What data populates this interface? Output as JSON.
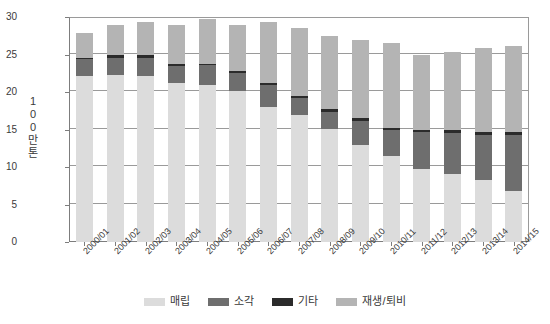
{
  "chart_data": {
    "type": "bar",
    "title": "",
    "subtitle": "",
    "xlabel": "",
    "ylabel": "100만 톤",
    "ylim": [
      0,
      30
    ],
    "yticks": [
      0,
      5,
      10,
      15,
      20,
      25,
      30
    ],
    "grid": true,
    "stacked": true,
    "legend_position": "bottom",
    "categories": [
      "2000/01",
      "2001/02",
      "2002/03",
      "2003/04",
      "2004/05",
      "2005/06",
      "2006/07",
      "2007/08",
      "2008/09",
      "2009/10",
      "2010/11",
      "2011/12",
      "2012/13",
      "2013/14",
      "2014/15"
    ],
    "series": [
      {
        "name": "매립",
        "color": "#dcdcdc",
        "values": [
          22.1,
          22.3,
          22.1,
          21.2,
          20.9,
          20.1,
          18.0,
          17.0,
          15.1,
          13.0,
          11.5,
          9.8,
          9.1,
          8.3,
          6.8
        ]
      },
      {
        "name": "소각",
        "color": "#6e6e6e",
        "values": [
          2.3,
          2.3,
          2.5,
          2.3,
          2.7,
          2.5,
          3.0,
          2.2,
          2.3,
          3.2,
          3.4,
          4.9,
          5.4,
          6.0,
          7.5
        ]
      },
      {
        "name": "기타",
        "color": "#2b2b2b",
        "values": [
          0.2,
          0.3,
          0.3,
          0.2,
          0.2,
          0.2,
          0.2,
          0.3,
          0.3,
          0.3,
          0.3,
          0.3,
          0.4,
          0.4,
          0.4
        ]
      },
      {
        "name": "재생/퇴비",
        "color": "#b4b4b4",
        "values": [
          3.3,
          4.0,
          4.5,
          5.2,
          5.9,
          6.1,
          8.1,
          9.1,
          9.8,
          10.5,
          11.4,
          10.0,
          10.4,
          11.2,
          11.5
        ]
      }
    ],
    "totals": [
      27.9,
      28.9,
      29.4,
      28.9,
      29.7,
      28.9,
      29.3,
      28.6,
      27.5,
      27.0,
      26.6,
      25.0,
      25.3,
      25.9,
      26.2
    ]
  },
  "legend": {
    "items": [
      {
        "label": "매립",
        "color": "#dcdcdc"
      },
      {
        "label": "소각",
        "color": "#6e6e6e"
      },
      {
        "label": "기타",
        "color": "#2b2b2b"
      },
      {
        "label": "재생/퇴비",
        "color": "#b4b4b4"
      }
    ]
  },
  "axis": {
    "y_title_chars": [
      "1",
      "0",
      "0",
      "만",
      "톤"
    ]
  }
}
